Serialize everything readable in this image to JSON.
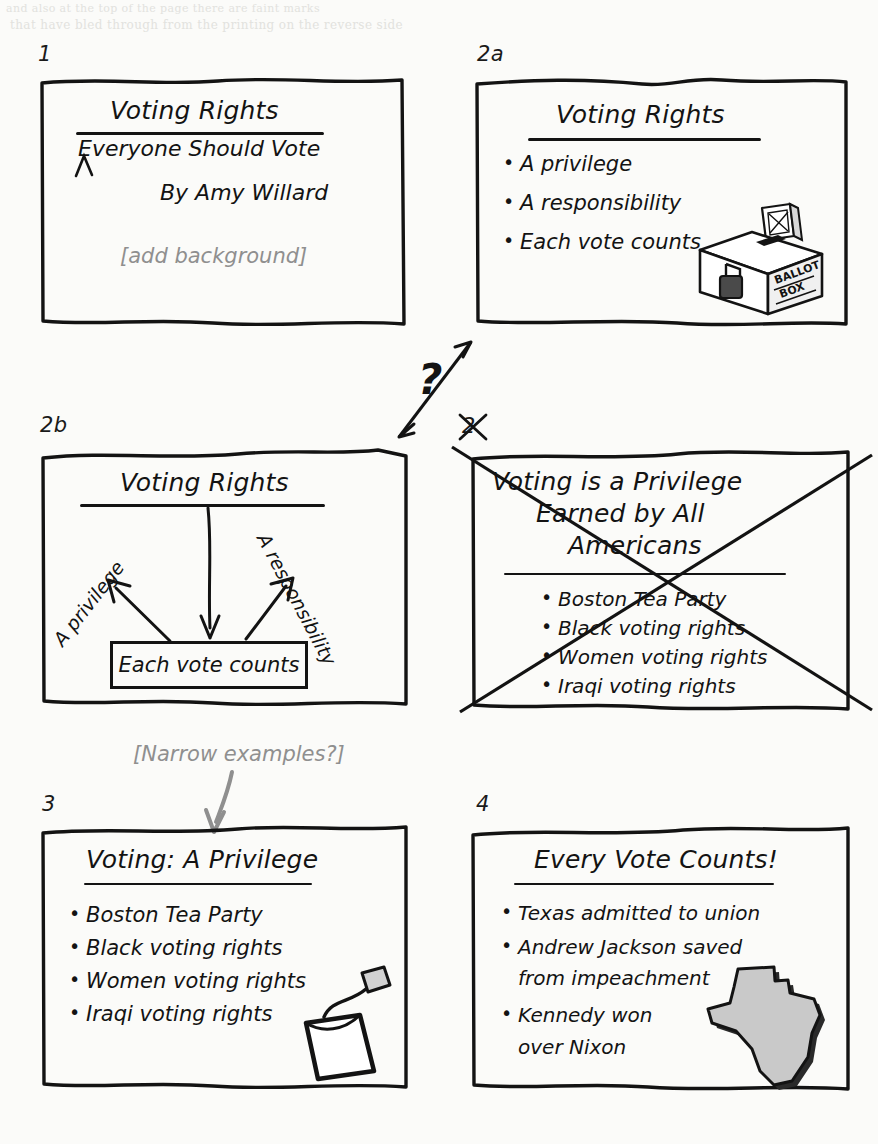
{
  "page": {
    "kind": "hand-drawn presentation storyboard",
    "background_color": "#fbfbf9",
    "ink_color": "#131313",
    "annotation_color": "#8f8f8f",
    "bleed_through": [
      "and also at the top of the page there are faint marks",
      "that have bled through from the printing on the reverse side"
    ]
  },
  "slides": [
    {
      "label": "1",
      "title": "Voting Rights",
      "has_title_rule": true,
      "lines": [
        "Everyone Should Vote",
        "By Amy Willard"
      ],
      "annotation": "[add background]",
      "caret_mark": true,
      "artwork": null,
      "struck_out": false
    },
    {
      "label": "2a",
      "title": "Voting Rights",
      "has_title_rule": true,
      "bullets": [
        "A privilege",
        "A responsibility",
        "Each vote counts"
      ],
      "artwork": "ballot-box",
      "artwork_caption": [
        "BALLOT",
        "BOX"
      ],
      "struck_out": false
    },
    {
      "label": "2b",
      "title": "Voting Rights",
      "has_title_rule": true,
      "diagram": {
        "left_label": "A privilege",
        "right_label": "A responsibility",
        "center_box": "Each vote counts",
        "arrows": 3
      },
      "artwork": null,
      "struck_out": false
    },
    {
      "label": "2",
      "title_lines": [
        "Voting is a Privilege",
        "Earned by All",
        "Americans"
      ],
      "has_title_rule": true,
      "bullets": [
        "Boston Tea Party",
        "Black voting rights",
        "Women voting rights",
        "Iraqi voting rights"
      ],
      "artwork": null,
      "struck_out": true,
      "label_struck_out": true
    },
    {
      "label": "3",
      "title": "Voting: A Privilege",
      "has_title_rule": true,
      "bullets": [
        "Boston Tea Party",
        "Black voting rights",
        "Women voting rights",
        "Iraqi voting rights"
      ],
      "artwork": "tea-bag",
      "struck_out": false
    },
    {
      "label": "4",
      "title": "Every Vote Counts!",
      "has_title_rule": true,
      "bullets": [
        "Texas admitted to union",
        "Andrew Jackson saved",
        "from impeachment",
        "Kennedy won",
        "over Nixon"
      ],
      "bullet_continuations": [
        2,
        4
      ],
      "artwork": "texas-map",
      "struck_out": false
    }
  ],
  "annotations": [
    {
      "name": "alternative-question",
      "text": "?",
      "description": "double-headed arrow between slide 2a and slide 2b with a question mark"
    },
    {
      "name": "narrow-examples-note",
      "text": "[Narrow examples?]",
      "description": "gray note with curved arrow pointing down into slide 3"
    }
  ]
}
